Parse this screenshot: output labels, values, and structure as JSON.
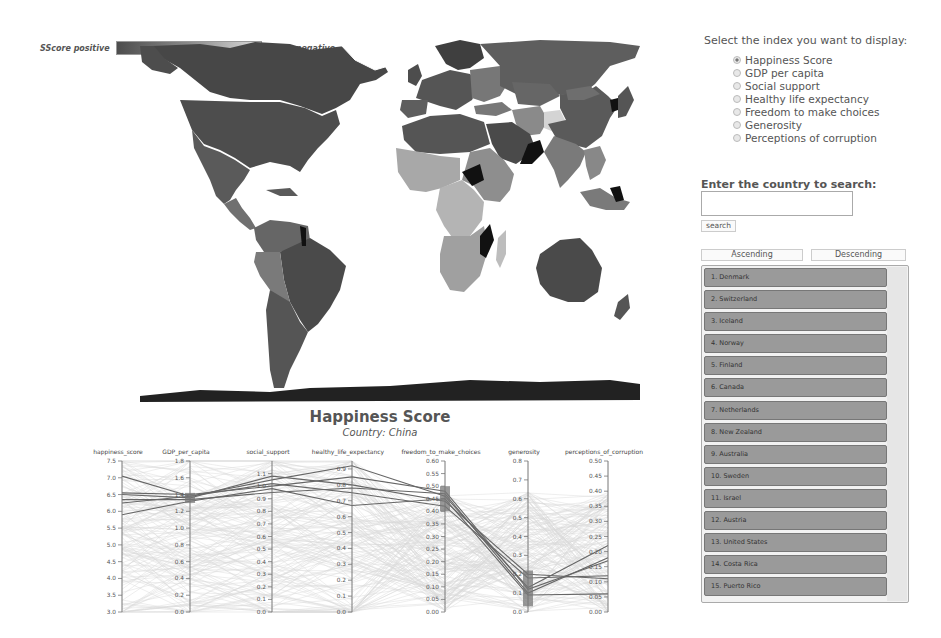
{
  "legend": {
    "positive_label": "SScore positive",
    "negative_label": "Score negative",
    "gradient_start": "#4d4d4d",
    "gradient_end": "#dcdcdc"
  },
  "map": {
    "projection": "world choropleth",
    "fill_scale": [
      "#3c3c3c",
      "#6a6a6a",
      "#9a9a9a",
      "#c8c8c8"
    ],
    "no_data_color": "#111111"
  },
  "panel": {
    "index_prompt": "Select the index you want to display:",
    "indices": [
      {
        "label": "Happiness Score",
        "selected": true
      },
      {
        "label": "GDP per capita",
        "selected": false
      },
      {
        "label": "Social support",
        "selected": false
      },
      {
        "label": "Healthy life expectancy",
        "selected": false
      },
      {
        "label": "Freedom to make choices",
        "selected": false
      },
      {
        "label": "Generosity",
        "selected": false
      },
      {
        "label": "Perceptions of corruption",
        "selected": false
      }
    ],
    "search_prompt": "Enter the country to search:",
    "search_value": "",
    "search_button": "search",
    "ascending_button": "Ascending",
    "descending_button": "Descending",
    "ranking": [
      "1. Denmark",
      "2. Switzerland",
      "3. Iceland",
      "4. Norway",
      "5. Finland",
      "6. Canada",
      "7. Netherlands",
      "8. New Zealand",
      "9. Australia",
      "10. Sweden",
      "11. Israel",
      "12. Austria",
      "13. United States",
      "14. Costa Rica",
      "15. Puerto Rico"
    ]
  },
  "chart": {
    "title": "Happiness Score",
    "subtitle": "Country: China"
  },
  "chart_data": {
    "type": "parallel_coordinates",
    "title": "Happiness Score",
    "subtitle": "Country: China",
    "axes": [
      {
        "name": "happiness_score",
        "range": [
          3.0,
          7.5
        ],
        "ticks": [
          "3.0",
          "3.5",
          "4.0",
          "4.5",
          "5.0",
          "5.5",
          "6.0",
          "6.5",
          "7.0",
          "7.5"
        ],
        "brush": null
      },
      {
        "name": "GDP_per_capita",
        "range": [
          0.0,
          1.8
        ],
        "ticks": [
          "0.0",
          "0.2",
          "0.4",
          "0.6",
          "0.8",
          "1.0",
          "1.2",
          "1.4",
          "1.6",
          "1.8"
        ],
        "brush": [
          1.3,
          1.42
        ]
      },
      {
        "name": "social_support",
        "range": [
          0.0,
          1.2
        ],
        "ticks": [
          "0.0",
          "0.1",
          "0.2",
          "0.3",
          "0.4",
          "0.5",
          "0.6",
          "0.7",
          "0.8",
          "0.9",
          "1.0",
          "1.1"
        ],
        "brush": null
      },
      {
        "name": "healthy_life_expectancy",
        "range": [
          0.0,
          0.95
        ],
        "ticks": [
          "0.0",
          "0.1",
          "0.2",
          "0.3",
          "0.4",
          "0.5",
          "0.6",
          "0.7",
          "0.8",
          "0.9"
        ],
        "brush": null
      },
      {
        "name": "freedom_to_make_choices",
        "range": [
          0.0,
          0.6
        ],
        "ticks": [
          "0.00",
          "0.05",
          "0.10",
          "0.15",
          "0.20",
          "0.25",
          "0.30",
          "0.35",
          "0.40",
          "0.45",
          "0.50",
          "0.55",
          "0.60"
        ],
        "brush": [
          0.4,
          0.5
        ]
      },
      {
        "name": "generosity",
        "range": [
          0.0,
          0.8
        ],
        "ticks": [
          "0.0",
          "0.1",
          "0.2",
          "0.3",
          "0.4",
          "0.5",
          "0.6",
          "0.7",
          "0.8"
        ],
        "brush": [
          0.03,
          0.22
        ]
      },
      {
        "name": "perceptions_of_corruption",
        "range": [
          0.0,
          0.5
        ],
        "ticks": [
          "0.00",
          "0.05",
          "0.10",
          "0.15",
          "0.20",
          "0.25",
          "0.30",
          "0.35",
          "0.40",
          "0.45",
          "0.50"
        ],
        "brush": null
      }
    ],
    "highlighted_lines": [
      [
        7.05,
        1.38,
        1.05,
        0.92,
        0.46,
        0.13,
        0.22
      ],
      [
        6.55,
        1.4,
        1.0,
        0.85,
        0.48,
        0.12,
        0.17
      ],
      [
        6.5,
        1.36,
        1.08,
        0.8,
        0.44,
        0.2,
        0.11
      ],
      [
        6.35,
        1.34,
        0.95,
        0.78,
        0.47,
        0.1,
        0.18
      ],
      [
        6.25,
        1.38,
        1.02,
        0.75,
        0.42,
        0.18,
        0.12
      ],
      [
        5.9,
        1.32,
        0.98,
        0.67,
        0.45,
        0.09,
        0.06
      ]
    ],
    "background_line_count": 150,
    "line_colors": {
      "background": "#d9d9d9",
      "highlighted": "#666666"
    }
  }
}
